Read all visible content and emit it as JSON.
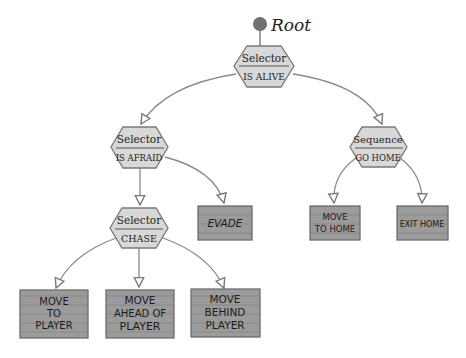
{
  "diagram": {
    "colors": {
      "background": "#ffffff",
      "edge": "#8a8a8a",
      "composite_fill": "#d8d8d8",
      "composite_stroke": "#7a7a7a",
      "leaf_fill": "#9b9b9b",
      "leaf_stroke": "#6e6e6e",
      "root_dot": "#707070"
    },
    "root": {
      "label": "Root"
    },
    "nodes": [
      {
        "id": "is-alive",
        "type": "Selector",
        "label": "IS ALIVE",
        "kind": "composite"
      },
      {
        "id": "is-afraid",
        "type": "Selector",
        "label": "IS AFRAID",
        "kind": "composite"
      },
      {
        "id": "go-home",
        "type": "Sequence",
        "label": "GO HOME",
        "kind": "composite"
      },
      {
        "id": "chase",
        "type": "Selector",
        "label": "CHASE",
        "kind": "composite"
      },
      {
        "id": "evade",
        "label": "EVADE",
        "kind": "leaf",
        "lines": [
          "EVADE"
        ]
      },
      {
        "id": "move-to-home",
        "label": "MOVE TO HOME",
        "kind": "leaf",
        "lines": [
          "MOVE",
          "TO HOME"
        ]
      },
      {
        "id": "exit-home",
        "label": "EXIT HOME",
        "kind": "leaf",
        "lines": [
          "EXIT HOME"
        ]
      },
      {
        "id": "move-to-player",
        "label": "MOVE TO PLAYER",
        "kind": "leaf",
        "lines": [
          "MOVE",
          "TO",
          "PLAYER"
        ]
      },
      {
        "id": "move-ahead-of-player",
        "label": "MOVE AHEAD OF PLAYER",
        "kind": "leaf",
        "lines": [
          "MOVE",
          "AHEAD OF",
          "PLAYER"
        ]
      },
      {
        "id": "move-behind-player",
        "label": "MOVE BEHIND PLAYER",
        "kind": "leaf",
        "lines": [
          "MOVE",
          "BEHIND",
          "PLAYER"
        ]
      }
    ],
    "edges": [
      {
        "from": "root",
        "to": "is-alive"
      },
      {
        "from": "is-alive",
        "to": "is-afraid"
      },
      {
        "from": "is-alive",
        "to": "go-home"
      },
      {
        "from": "is-afraid",
        "to": "chase"
      },
      {
        "from": "is-afraid",
        "to": "evade"
      },
      {
        "from": "go-home",
        "to": "move-to-home"
      },
      {
        "from": "go-home",
        "to": "exit-home"
      },
      {
        "from": "chase",
        "to": "move-to-player"
      },
      {
        "from": "chase",
        "to": "move-ahead-of-player"
      },
      {
        "from": "chase",
        "to": "move-behind-player"
      }
    ]
  }
}
